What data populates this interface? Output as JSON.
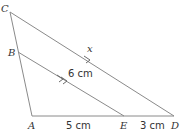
{
  "diagram": {
    "type": "geometry-triangle-parallel-lines",
    "points": {
      "A": {
        "label": "A",
        "x": 32,
        "y": 116
      },
      "B": {
        "label": "B",
        "x": 18,
        "y": 52
      },
      "C": {
        "label": "C",
        "x": 10,
        "y": 12
      },
      "D": {
        "label": "D",
        "x": 174,
        "y": 116
      },
      "E": {
        "label": "E",
        "x": 124,
        "y": 116
      }
    },
    "segments": [
      "C-A",
      "A-D",
      "C-D",
      "B-E"
    ],
    "parallel": [
      "B-E",
      "C-D"
    ],
    "labels": {
      "x_label": "x",
      "be_length": "6 cm",
      "ae_length": "5 cm",
      "ed_length": "3 cm"
    },
    "colors": {
      "line": "#8a8a8a",
      "text": "#333333"
    }
  }
}
